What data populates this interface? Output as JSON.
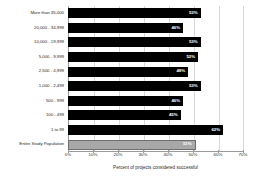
{
  "chart_data": {
    "type": "bar",
    "orientation": "horizontal",
    "title": "",
    "xlabel": "Percent of projects considered successful",
    "ylabel": "",
    "xlim": [
      0,
      70
    ],
    "xtick_labels": [
      "0%",
      "10%",
      "20%",
      "30%",
      "40%",
      "50%",
      "60%",
      "70%"
    ],
    "xtick_values": [
      0,
      10,
      20,
      30,
      40,
      50,
      60,
      70
    ],
    "grid": true,
    "legend": null,
    "categories": [
      "More than 35,000",
      "20,000 - 34,999",
      "10,000 - 19,999",
      "5,000 - 9,999",
      "2,500 - 4,999",
      "1,000 - 2,499",
      "500 - 999",
      "100 - 499",
      "1 to 99",
      "Entire Study Population"
    ],
    "values": [
      53,
      46,
      53,
      52,
      48,
      53,
      46,
      45,
      62,
      51
    ],
    "value_labels": [
      "53%",
      "46%",
      "53%",
      "52%",
      "48%",
      "53%",
      "46%",
      "45%",
      "62%",
      "51%"
    ],
    "bar_colors": [
      "#000000",
      "#000000",
      "#000000",
      "#000000",
      "#000000",
      "#000000",
      "#000000",
      "#000000",
      "#000000",
      "#a8a8a8"
    ]
  }
}
